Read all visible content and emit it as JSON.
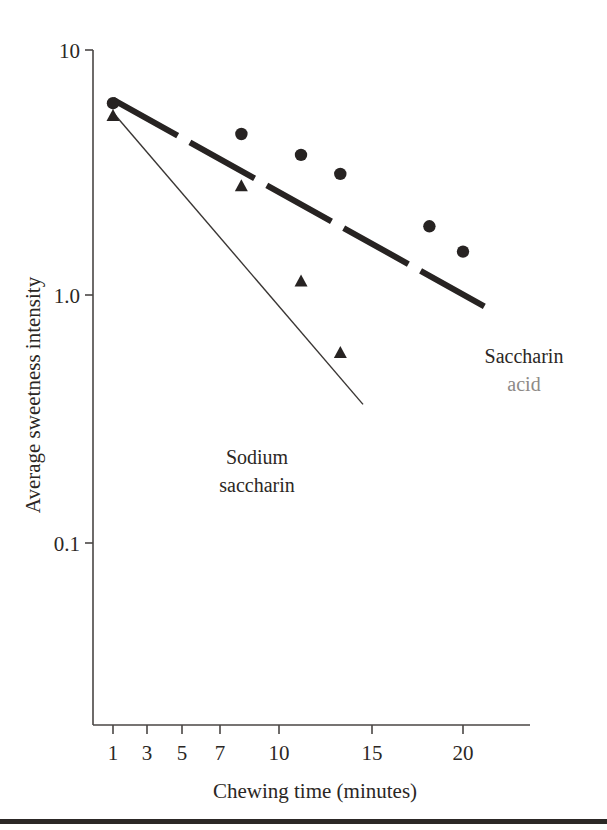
{
  "chart_data": {
    "type": "scatter",
    "title": "",
    "xlabel": "Chewing time (minutes)",
    "ylabel": "Average sweetness intensity",
    "xscale": "log",
    "yscale": "log",
    "xticks": [
      1,
      3,
      5,
      7,
      10,
      15,
      20
    ],
    "xticklabels": [
      "1",
      "3",
      "5",
      "7",
      "10",
      "15",
      "20"
    ],
    "yticks": [
      10,
      1.0,
      0.1
    ],
    "yticklabels": [
      "10",
      "1.0",
      "0.1"
    ],
    "xlim": [
      0.85,
      26
    ],
    "ylim": [
      0.055,
      11
    ],
    "grid": false,
    "legend": "inline annotations",
    "series": [
      {
        "name": "Saccharin acid",
        "marker": "circle",
        "line": "dashed-thick",
        "points": [
          {
            "x": 1,
            "y": 6.0
          },
          {
            "x": 3,
            "y": 4.5
          },
          {
            "x": 5,
            "y": 3.7
          },
          {
            "x": 7,
            "y": 3.1
          },
          {
            "x": 15,
            "y": 1.9
          },
          {
            "x": 20,
            "y": 1.5
          }
        ],
        "trendline": [
          {
            "x": 1,
            "y": 6.2
          },
          {
            "x": 24,
            "y": 0.9
          }
        ]
      },
      {
        "name": "Sodium saccharin",
        "marker": "triangle",
        "line": "solid-thin",
        "points": [
          {
            "x": 1,
            "y": 5.3
          },
          {
            "x": 3,
            "y": 2.75
          },
          {
            "x": 5,
            "y": 1.13
          },
          {
            "x": 7,
            "y": 0.58
          }
        ],
        "trendline": [
          {
            "x": 1,
            "y": 5.5
          },
          {
            "x": 8.5,
            "y": 0.36
          }
        ]
      }
    ],
    "annotations": [
      {
        "text_line1": "Saccharin",
        "text_line2": "acid",
        "x": 20,
        "y": 0.52
      },
      {
        "text_line1": "Sodium",
        "text_line2": "saccharin",
        "x": 5.2,
        "y": 0.24
      }
    ]
  },
  "axes": {
    "y": {
      "title": "Average sweetness intensity",
      "labels": [
        "10",
        "1.0",
        "0.1"
      ]
    },
    "x": {
      "title": "Chewing time (minutes)",
      "labels": [
        "1",
        "3",
        "5",
        "7",
        "10",
        "15",
        "20"
      ]
    }
  },
  "annotations": {
    "saccharin_acid_line1": "Saccharin",
    "saccharin_acid_line2": "acid",
    "sodium_saccharin_line1": "Sodium",
    "sodium_saccharin_line2": "saccharin"
  },
  "colors": {
    "ink": "#272322",
    "axis": "#4a4644",
    "faded_text": "#8d8a87",
    "footer_bar": "#2c2826",
    "background": "#ffffff"
  }
}
